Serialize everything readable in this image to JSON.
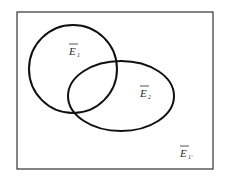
{
  "diagram": {
    "type": "venn",
    "universe": {
      "x": 17,
      "y": 12,
      "width": 196,
      "height": 157,
      "label": "E",
      "label_sub": "1'",
      "label_overbar": true
    },
    "sets": [
      {
        "name": "E1",
        "shape": "circle",
        "cx": 73,
        "cy": 69,
        "r": 44,
        "label": "E",
        "label_sub": "1",
        "label_overbar": true
      },
      {
        "name": "E2",
        "shape": "ellipse",
        "cx": 121,
        "cy": 96,
        "rx": 53,
        "ry": 35,
        "label": "E",
        "label_sub": "2",
        "label_overbar": true
      }
    ],
    "colors": {
      "stroke": "#111111",
      "frame": "#333333",
      "background": "#ffffff"
    }
  }
}
